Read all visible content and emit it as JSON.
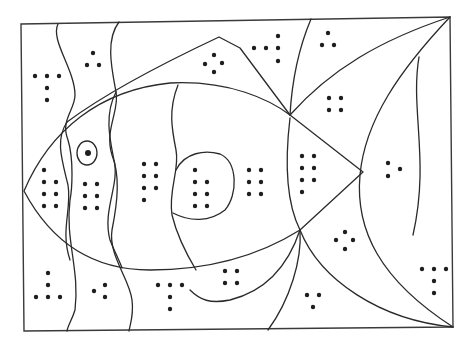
{
  "worksheet": {
    "title": "Fish dot-count coloring page",
    "colors": {
      "line": "#2a2a2a",
      "dot": "#1e1e1e",
      "background": "#ffffff"
    },
    "regions": [
      {
        "id": "bg-top-left",
        "dots": 5
      },
      {
        "id": "bg-top-2",
        "dots": 3
      },
      {
        "id": "fin-top",
        "dots": 4
      },
      {
        "id": "bg-top-4",
        "dots": 5
      },
      {
        "id": "bg-top-5",
        "dots": 3
      },
      {
        "id": "tail-upper",
        "dots": 4
      },
      {
        "id": "head",
        "dots": 7
      },
      {
        "id": "body-stripe-1",
        "dots": 6
      },
      {
        "id": "body-stripe-2",
        "dots": 7
      },
      {
        "id": "body-spot",
        "dots": 7
      },
      {
        "id": "body-mid",
        "dots": 6
      },
      {
        "id": "body-rear",
        "dots": 7
      },
      {
        "id": "tail-right",
        "dots": 3
      },
      {
        "id": "bg-bottom-left",
        "dots": 5
      },
      {
        "id": "bg-bottom-2",
        "dots": 3
      },
      {
        "id": "bg-bottom-3",
        "dots": 5
      },
      {
        "id": "fin-bottom",
        "dots": 4
      },
      {
        "id": "bg-bottom-5",
        "dots": 3
      },
      {
        "id": "tail-lower",
        "dots": 4
      },
      {
        "id": "bg-bottom-right",
        "dots": 5
      }
    ],
    "eye": {
      "label": "fish eye"
    }
  }
}
